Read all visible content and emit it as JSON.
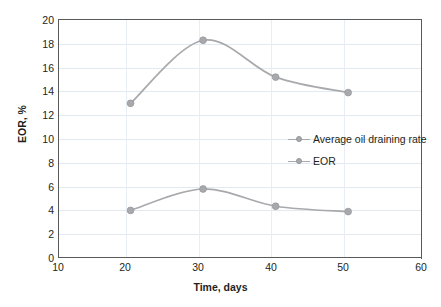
{
  "chart_data": {
    "type": "line",
    "title": "",
    "xlabel": "Time, days",
    "ylabel": "EOR, %",
    "xlim": [
      10,
      60
    ],
    "ylim": [
      0,
      20
    ],
    "xticks": [
      10,
      20,
      30,
      40,
      50,
      60
    ],
    "yticks": [
      0,
      2,
      4,
      6,
      8,
      10,
      12,
      14,
      16,
      18,
      20
    ],
    "grid": true,
    "legend_position": "center-right",
    "x": [
      20,
      30,
      40,
      50
    ],
    "series": [
      {
        "name": "Average oil draining rate",
        "values": [
          13.0,
          18.3,
          15.2,
          13.9
        ],
        "color": "#a7a9ac",
        "marker": "circle"
      },
      {
        "name": "EOR",
        "values": [
          4.0,
          5.8,
          4.35,
          3.9
        ],
        "color": "#a7a9ac",
        "marker": "circle"
      }
    ]
  },
  "axes": {
    "y_tick_labels": [
      "20",
      "18",
      "16",
      "14",
      "12",
      "10",
      "8",
      "6",
      "4",
      "2",
      "0"
    ],
    "x_tick_labels": [
      "10",
      "20",
      "30",
      "40",
      "50",
      "60"
    ],
    "y_title": "EOR, %",
    "x_title": "Time, days"
  },
  "legend": {
    "items": [
      {
        "label": "Average oil draining rate"
      },
      {
        "label": "EOR"
      }
    ]
  },
  "colors": {
    "series": "#a7a9ac",
    "axis": "#58595b",
    "grid": "#e3e9f0",
    "text": "#231f20",
    "background": "#ffffff"
  }
}
